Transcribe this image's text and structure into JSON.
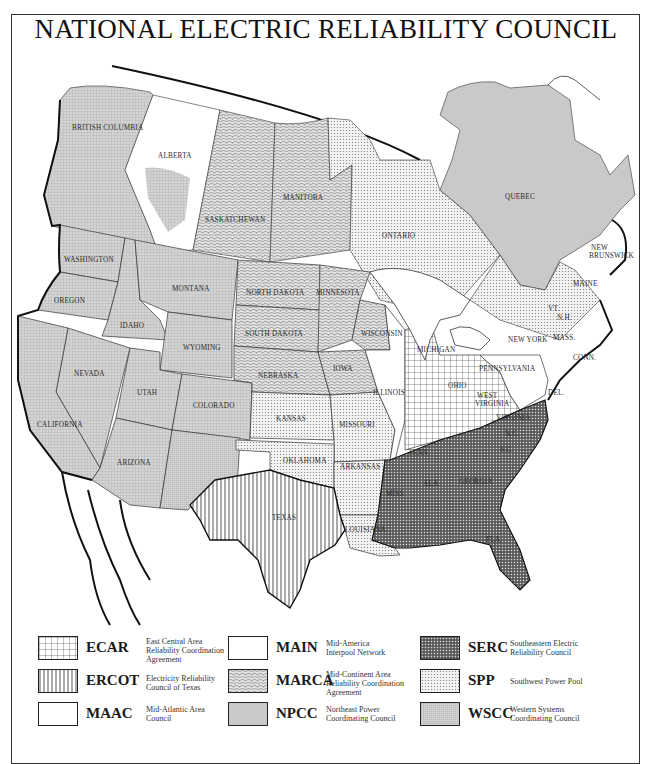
{
  "title": "NATIONAL ELECTRIC RELIABILITY COUNCIL",
  "colors": {
    "wscc": "#cfcfcf",
    "npcc": "#c9c9c9",
    "marca": "#d6d6d6",
    "spp": "#e4e4e4",
    "serc": "#6a6a6a",
    "ecar": "#ffffff",
    "ercot": "#ffffff",
    "main": "#ffffff",
    "maac": "#ffffff",
    "ink": "#1a1a1a"
  },
  "map": {
    "labels": {
      "british_columbia": "BRITISH COLUMBIA",
      "alberta": "ALBERTA",
      "saskatchewan": "SASKATCHEWAN",
      "manitoba": "MANITOBA",
      "ontario": "ONTARIO",
      "quebec": "QUEBEC",
      "new": "NEW",
      "brunswick": "BRUNSWICK",
      "washington": "WASHINGTON",
      "oregon": "OREGON",
      "idaho": "IDAHO",
      "montana": "MONTANA",
      "wyoming": "WYOMING",
      "nevada": "NEVADA",
      "utah": "UTAH",
      "colorado": "COLORADO",
      "california": "CALIFORNIA",
      "arizona": "ARIZONA",
      "north_dakota": "NORTH DAKOTA",
      "south_dakota": "SOUTH DAKOTA",
      "nebraska": "NEBRASKA",
      "kansas": "KANSAS",
      "minnesota": "MINNESOTA",
      "iowa": "IOWA",
      "wisconsin": "WISCONSIN",
      "illinois": "ILLINOIS",
      "missouri": "MISSOURI",
      "michigan": "MICHIGAN",
      "ohio": "OHIO",
      "pennsylvania": "PENNSYLVANIA",
      "new_york": "NEW YORK",
      "west": "WEST",
      "virginia_w": "VIRGINIA",
      "virginia": "VIRGINIA",
      "del": "DEL.",
      "conn": "CONN.",
      "maine": "MAINE",
      "vt": "VT.",
      "nh": "N.H.",
      "mass": "MASS.",
      "oklahoma": "OKLAHOMA",
      "arkansas": "ARKANSAS",
      "texas": "TEXAS",
      "louisiana": "LOUISIANA",
      "miss": "MISS.",
      "ala": "ALA.",
      "georgia": "GEORGIA",
      "fla": "FLA.",
      "nc": "N.C.",
      "sc": "S.C.",
      "tenn": "TENN."
    }
  },
  "legend": [
    {
      "code": "ECAR",
      "pattern": "grid",
      "description": [
        "East Central Area",
        "Reliability Coordination",
        "Agreement"
      ]
    },
    {
      "code": "ERCOT",
      "pattern": "vertical-lines",
      "description": [
        "Electricity Reliability",
        "Council of Texas"
      ]
    },
    {
      "code": "MAAC",
      "pattern": "blank",
      "description": [
        "Mid-Atlantic Area",
        "Council"
      ]
    },
    {
      "code": "MAIN",
      "pattern": "blank",
      "description": [
        "Mid-America",
        "Interpool Network"
      ]
    },
    {
      "code": "MARCA",
      "pattern": "wavy-texture",
      "description": [
        "Mid-Continent Area",
        "Reliability Coordination",
        "Agreement"
      ]
    },
    {
      "code": "NPCC",
      "pattern": "solid-gray",
      "description": [
        "Northeast Power",
        "Coordinating Council"
      ]
    },
    {
      "code": "SERC",
      "pattern": "dense-crosshatch",
      "description": [
        "Southeastern Electric",
        "Reliability Council"
      ]
    },
    {
      "code": "SPP",
      "pattern": "dots",
      "description": [
        "Southwest Power Pool"
      ]
    },
    {
      "code": "WSCC",
      "pattern": "fine-gray-grid",
      "description": [
        "Western Systems",
        "Coordinating Council"
      ]
    }
  ]
}
